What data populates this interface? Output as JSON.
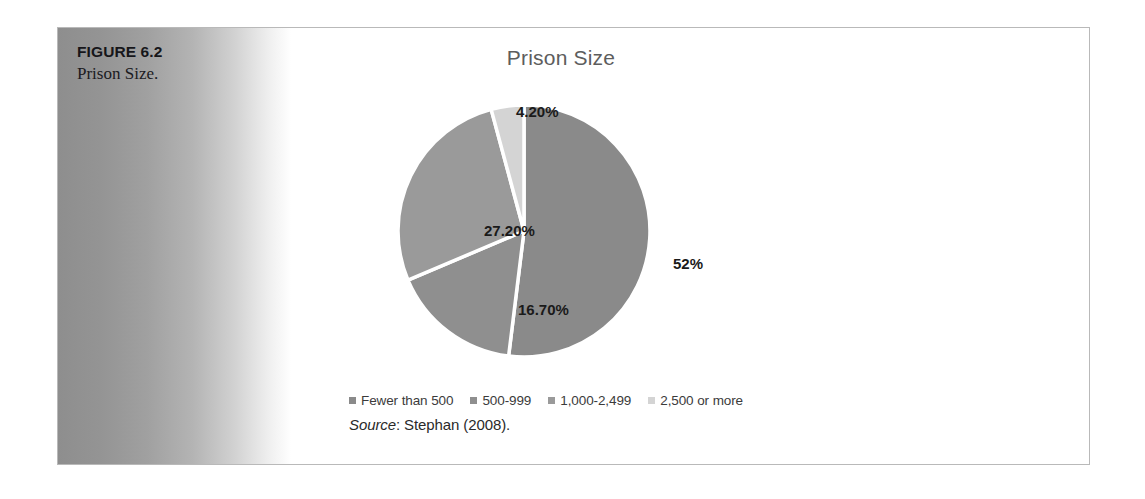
{
  "figure": {
    "number": "FIGURE 6.2",
    "caption": "Prison Size."
  },
  "chart": {
    "title": "Prison Size",
    "source_word": "Source",
    "source_rest": ": Stephan (2008)."
  },
  "chart_data": {
    "type": "pie",
    "title": "Prison Size",
    "categories": [
      "Fewer than 500",
      "500-999",
      "1,000-2,499",
      "2,500 or more"
    ],
    "values": [
      52,
      16.7,
      27.2,
      4.2
    ],
    "labels": [
      "52%",
      "16.70%",
      "27.20%",
      "4.20%"
    ],
    "colors": [
      "#8a8a8a",
      "#8f8f8f",
      "#9a9a9a",
      "#d4d4d4"
    ],
    "legend_position": "bottom",
    "start_angle_deg": 0,
    "direction": "clockwise",
    "slice_gap": true,
    "grid": false,
    "xlabel": "",
    "ylabel": ""
  },
  "legend": [
    {
      "label": "Fewer than 500",
      "color": "#8a8a8a"
    },
    {
      "label": "500-999",
      "color": "#8f8f8f"
    },
    {
      "label": "1,000-2,499",
      "color": "#9a9a9a"
    },
    {
      "label": "2,500 or more",
      "color": "#d4d4d4"
    }
  ]
}
